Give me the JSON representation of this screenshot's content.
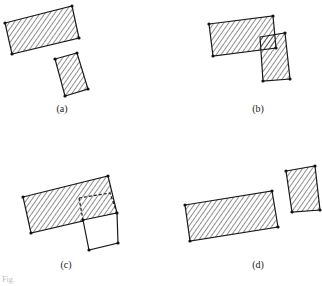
{
  "figure": {
    "panels": [
      {
        "id": "a",
        "label": "(a)",
        "label_pos": [
          62,
          103
        ]
      },
      {
        "id": "b",
        "label": "(b)",
        "label_pos": [
          258,
          103
        ]
      },
      {
        "id": "c",
        "label": "(c)",
        "label_pos": [
          66,
          260
        ]
      },
      {
        "id": "d",
        "label": "(d)",
        "label_pos": [
          258,
          260
        ]
      }
    ],
    "caption": "Fig."
  },
  "colors": {
    "stroke": "#1a1a1a",
    "background": "#ffffff"
  }
}
